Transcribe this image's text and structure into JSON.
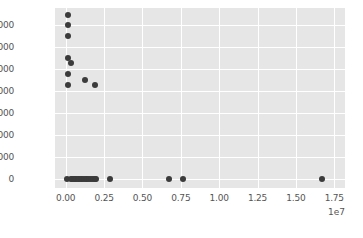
{
  "chart_data": {
    "type": "scatter",
    "title": "",
    "xlabel": "",
    "ylabel": "",
    "grid": true,
    "legend": null,
    "xlim": [
      -700000,
      18200000
    ],
    "ylim": [
      -8000,
      155000
    ],
    "x_offset_text": "1e7",
    "x_offset_multiplier": 10000000,
    "xticks": [
      0,
      2500000,
      5000000,
      7500000,
      10000000,
      12500000,
      15000000,
      17500000
    ],
    "xtick_labels": [
      "0.00",
      "0.25",
      "0.50",
      "0.75",
      "1.00",
      "1.25",
      "1.50",
      "1.75"
    ],
    "yticks": [
      0,
      20000,
      40000,
      60000,
      80000,
      100000,
      120000,
      140000
    ],
    "ytick_labels": [
      "0",
      "20000",
      "40000",
      "60000",
      "80000",
      "100000",
      "120000",
      "140000"
    ],
    "marker": "circle",
    "marker_color": "#3b3b3b",
    "marker_size": 6,
    "points": [
      {
        "x": 120000,
        "y": 149000
      },
      {
        "x": 120000,
        "y": 140000
      },
      {
        "x": 120000,
        "y": 130000
      },
      {
        "x": 130000,
        "y": 110000
      },
      {
        "x": 330000,
        "y": 105500
      },
      {
        "x": 120000,
        "y": 95500
      },
      {
        "x": 1250000,
        "y": 89500
      },
      {
        "x": 120000,
        "y": 85000
      },
      {
        "x": 1900000,
        "y": 85000
      },
      {
        "x": 60000,
        "y": 0
      },
      {
        "x": 330000,
        "y": 0
      },
      {
        "x": 430000,
        "y": 0
      },
      {
        "x": 530000,
        "y": 0
      },
      {
        "x": 620000,
        "y": 0
      },
      {
        "x": 700000,
        "y": 0
      },
      {
        "x": 790000,
        "y": 0
      },
      {
        "x": 880000,
        "y": 0
      },
      {
        "x": 980000,
        "y": 0
      },
      {
        "x": 1080000,
        "y": 0
      },
      {
        "x": 1180000,
        "y": 0
      },
      {
        "x": 1300000,
        "y": 0
      },
      {
        "x": 1400000,
        "y": 0
      },
      {
        "x": 1520000,
        "y": 0
      },
      {
        "x": 1640000,
        "y": 0
      },
      {
        "x": 1760000,
        "y": 0
      },
      {
        "x": 1880000,
        "y": 0
      },
      {
        "x": 2000000,
        "y": 0
      },
      {
        "x": 2880000,
        "y": 0
      },
      {
        "x": 6720000,
        "y": 0
      },
      {
        "x": 7660000,
        "y": 0
      },
      {
        "x": 16700000,
        "y": 0
      }
    ]
  },
  "style": {
    "figure_background": "#ffffff",
    "axes_background": "#e6e6e6",
    "grid_color": "#ffffff",
    "tick_label_color": "#555555"
  }
}
